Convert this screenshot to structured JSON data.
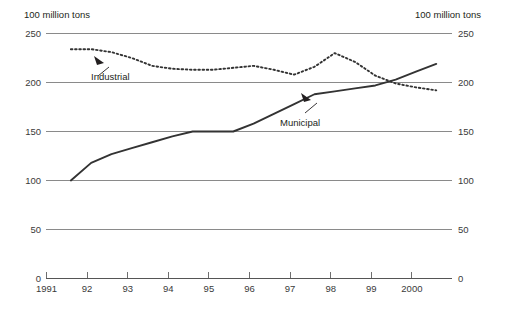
{
  "figure": {
    "unit_label_left": "100 million tons",
    "unit_label_right": "100 million tons",
    "background_color": "#ffffff",
    "line_color": "#333333",
    "grid_color": "#8a8a8a"
  },
  "annotations": {
    "industrial_label": "Industrial",
    "municipal_label": "Municipal"
  },
  "axis": {
    "y_ticks_left": [
      "250",
      "200",
      "150",
      "100",
      "50",
      "0"
    ],
    "y_ticks_right": [
      "250",
      "200",
      "150",
      "100",
      "50",
      "0"
    ],
    "x_ticks": [
      "1991",
      "92",
      "93",
      "94",
      "95",
      "96",
      "97",
      "98",
      "99",
      "2000"
    ]
  },
  "chart_data": {
    "type": "line",
    "title": "",
    "subtitle": "",
    "xlabel": "",
    "ylabel": "100 million tons",
    "ylim": [
      0,
      250
    ],
    "xlim": [
      1991,
      2000.95
    ],
    "grid": true,
    "grid_axis": "y",
    "yticks": [
      0,
      50,
      100,
      150,
      200,
      250
    ],
    "xticks": [
      1991,
      1992,
      1993,
      1994,
      1995,
      1996,
      1997,
      1998,
      1999,
      2000
    ],
    "xtick_labels": [
      "1991",
      "92",
      "93",
      "94",
      "95",
      "96",
      "97",
      "98",
      "99",
      "2000"
    ],
    "legend": "inline-annotations",
    "annotations": [
      {
        "text": "Industrial",
        "series": "Industrial",
        "x": 1992.1,
        "y": 232
      },
      {
        "text": "Municipal",
        "series": "Municipal",
        "x": 1996.6,
        "y": 176
      }
    ],
    "series": [
      {
        "name": "Industrial",
        "style": "dotted",
        "color": "#333333",
        "x": [
          1991.6,
          1992.1,
          1992.6,
          1993.1,
          1993.6,
          1994.1,
          1994.6,
          1995.1,
          1995.6,
          1996.1,
          1996.6,
          1997.1,
          1997.6,
          1998.1,
          1998.6,
          1999.1,
          1999.6,
          2000.1,
          2000.6
        ],
        "values": [
          234,
          234,
          231,
          225,
          217,
          214,
          213,
          213,
          215,
          217,
          213,
          208,
          216,
          230,
          221,
          207,
          199,
          195,
          192
        ]
      },
      {
        "name": "Municipal",
        "style": "solid",
        "color": "#333333",
        "x": [
          1991.6,
          1992.1,
          1992.6,
          1993.1,
          1993.6,
          1994.1,
          1994.6,
          1995.1,
          1995.6,
          1996.1,
          1996.6,
          1997.1,
          1997.6,
          1998.1,
          1998.6,
          1999.1,
          1999.6,
          2000.1,
          2000.6
        ],
        "values": [
          100,
          118,
          127,
          133,
          139,
          145,
          150,
          150,
          150,
          158,
          168,
          178,
          188,
          191,
          194,
          197,
          203,
          211,
          219
        ]
      }
    ]
  }
}
